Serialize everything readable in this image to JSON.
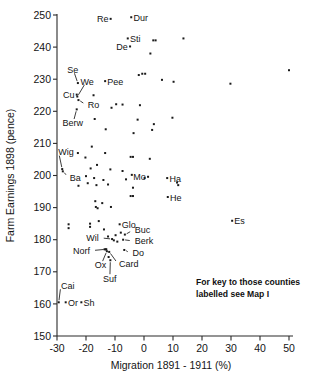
{
  "chart_data": {
    "type": "scatter",
    "title": "",
    "xlabel": "Migration  1891 - 1911 (%)",
    "ylabel": "Farm Earnings 1898 (pence)",
    "xlim": [
      -30,
      50
    ],
    "ylim": [
      150,
      250
    ],
    "xticks": [
      -30,
      -20,
      -10,
      0,
      10,
      20,
      30,
      40,
      50
    ],
    "yticks": [
      150,
      160,
      170,
      180,
      190,
      200,
      210,
      220,
      230,
      240,
      250
    ],
    "grid": false,
    "legend": null,
    "annotation": "For key to those counties labelled see Map I",
    "annotation_lines": [
      "For key to those counties",
      "labelled see Map I"
    ],
    "labelled_points": [
      {
        "label": "Re",
        "x": -11.5,
        "y": 248.8,
        "lx": -14.8,
        "ly": 248.8,
        "anchor": "end",
        "leader": false
      },
      {
        "label": "Dur",
        "x": -4.4,
        "y": 249.3,
        "lx": -3.5,
        "ly": 249.3,
        "anchor": "start",
        "leader": false
      },
      {
        "label": "Sti",
        "x": -5.6,
        "y": 242.7,
        "lx": -4.8,
        "ly": 242.5,
        "anchor": "start",
        "leader": false
      },
      {
        "label": "De",
        "x": -4.8,
        "y": 240.2,
        "lx": -6.0,
        "ly": 240.0,
        "anchor": "end",
        "leader": false
      },
      {
        "label": "Se",
        "x": -22.8,
        "y": 228.8,
        "lx": -24.6,
        "ly": 233.0,
        "anchor": "middle",
        "leader": true
      },
      {
        "label": "We",
        "x": -23.0,
        "y": 224.6,
        "lx": -19.6,
        "ly": 229.3,
        "anchor": "middle",
        "leader": true
      },
      {
        "label": "Pee",
        "x": -13.4,
        "y": 229.4,
        "lx": -12.6,
        "ly": 229.3,
        "anchor": "start",
        "leader": false
      },
      {
        "label": "Cu",
        "x": -23.2,
        "y": 225.2,
        "lx": -25.0,
        "ly": 225.2,
        "anchor": "end",
        "leader": false
      },
      {
        "label": "Ro",
        "x": -22.6,
        "y": 223.5,
        "lx": -19.4,
        "ly": 222.0,
        "anchor": "start",
        "leader": true
      },
      {
        "label": "Berw",
        "x": -23.2,
        "y": 220.6,
        "lx": -24.6,
        "ly": 216.4,
        "anchor": "middle",
        "leader": true
      },
      {
        "label": "Wig",
        "x": -28.2,
        "y": 202.0,
        "lx": -29.6,
        "ly": 207.4,
        "anchor": "start",
        "leader": true
      },
      {
        "label": "Ba",
        "x": -28.0,
        "y": 201.3,
        "lx": -25.6,
        "ly": 199.4,
        "anchor": "start",
        "leader": true
      },
      {
        "label": "Mo",
        "x": 1.4,
        "y": 199.6,
        "lx": 0.4,
        "ly": 199.6,
        "anchor": "end",
        "leader": false
      },
      {
        "label": "Ha",
        "x": 8.0,
        "y": 199.2,
        "lx": 8.8,
        "ly": 199.1,
        "anchor": "start",
        "leader": false
      },
      {
        "label": "He",
        "x": 8.2,
        "y": 193.3,
        "lx": 9.0,
        "ly": 193.2,
        "anchor": "start",
        "leader": false
      },
      {
        "label": "Es",
        "x": 30.4,
        "y": 185.9,
        "lx": 31.2,
        "ly": 185.8,
        "anchor": "start",
        "leader": false
      },
      {
        "label": "Glo",
        "x": -8.4,
        "y": 184.8,
        "lx": -7.6,
        "ly": 184.7,
        "anchor": "start",
        "leader": false
      },
      {
        "label": "Buc",
        "x": -6.6,
        "y": 181.6,
        "lx": -3.2,
        "ly": 183.0,
        "anchor": "start",
        "leader": true
      },
      {
        "label": "Wil",
        "x": -11.0,
        "y": 180.2,
        "lx": -15.6,
        "ly": 180.6,
        "anchor": "end",
        "leader": true
      },
      {
        "label": "Berk",
        "x": -7.2,
        "y": 180.0,
        "lx": -3.2,
        "ly": 179.6,
        "anchor": "start",
        "leader": true
      },
      {
        "label": "Norf",
        "x": -13.2,
        "y": 177.0,
        "lx": -18.6,
        "ly": 176.6,
        "anchor": "end",
        "leader": true
      },
      {
        "label": "Do",
        "x": -6.8,
        "y": 176.8,
        "lx": -4.0,
        "ly": 175.8,
        "anchor": "start",
        "leader": true
      },
      {
        "label": "Ox",
        "x": -12.8,
        "y": 176.4,
        "lx": -15.0,
        "ly": 172.2,
        "anchor": "middle",
        "leader": true
      },
      {
        "label": "Card",
        "x": -12.0,
        "y": 176.2,
        "lx": -8.6,
        "ly": 172.4,
        "anchor": "start",
        "leader": true
      },
      {
        "label": "Suf",
        "x": -11.6,
        "y": 173.6,
        "lx": -11.8,
        "ly": 168.0,
        "anchor": "middle",
        "leader": true
      },
      {
        "label": "Cai",
        "x": -29.4,
        "y": 160.5,
        "lx": -28.6,
        "ly": 165.8,
        "anchor": "start",
        "leader": true
      },
      {
        "label": "Or",
        "x": -27.0,
        "y": 160.5,
        "lx": -26.2,
        "ly": 160.4,
        "anchor": "start",
        "leader": false
      },
      {
        "label": "Sh",
        "x": -21.6,
        "y": 160.5,
        "lx": -20.8,
        "ly": 160.4,
        "anchor": "start",
        "leader": false
      }
    ],
    "unlabelled_points": [
      {
        "x": 3.2,
        "y": 242.1
      },
      {
        "x": 4.0,
        "y": 242.1
      },
      {
        "x": 13.6,
        "y": 242.7
      },
      {
        "x": 2.2,
        "y": 238.0
      },
      {
        "x": 50.0,
        "y": 232.8
      },
      {
        "x": -1.8,
        "y": 231.3
      },
      {
        "x": -0.6,
        "y": 231.7
      },
      {
        "x": 0.4,
        "y": 231.7
      },
      {
        "x": 6.2,
        "y": 229.8
      },
      {
        "x": 10.2,
        "y": 229.2
      },
      {
        "x": 29.8,
        "y": 228.6
      },
      {
        "x": -17.4,
        "y": 225.0
      },
      {
        "x": -9.6,
        "y": 222.2
      },
      {
        "x": -7.4,
        "y": 222.1
      },
      {
        "x": -1.4,
        "y": 221.9
      },
      {
        "x": -11.2,
        "y": 221.1
      },
      {
        "x": -17.0,
        "y": 217.6
      },
      {
        "x": -2.2,
        "y": 217.4
      },
      {
        "x": 9.8,
        "y": 218.0
      },
      {
        "x": 3.4,
        "y": 216.0
      },
      {
        "x": -13.2,
        "y": 214.4
      },
      {
        "x": -3.6,
        "y": 213.2
      },
      {
        "x": 2.8,
        "y": 214.2
      },
      {
        "x": -18.0,
        "y": 209.0
      },
      {
        "x": -22.8,
        "y": 207.0
      },
      {
        "x": -13.4,
        "y": 207.0
      },
      {
        "x": -20.2,
        "y": 205.6
      },
      {
        "x": -4.6,
        "y": 205.8
      },
      {
        "x": -3.8,
        "y": 205.8
      },
      {
        "x": 2.0,
        "y": 205.2
      },
      {
        "x": -16.2,
        "y": 203.3
      },
      {
        "x": -18.4,
        "y": 202.2
      },
      {
        "x": -11.6,
        "y": 201.9
      },
      {
        "x": -7.4,
        "y": 201.4
      },
      {
        "x": -4.2,
        "y": 200.2
      },
      {
        "x": -20.0,
        "y": 199.8
      },
      {
        "x": -17.2,
        "y": 199.2
      },
      {
        "x": -14.0,
        "y": 198.6
      },
      {
        "x": -6.2,
        "y": 198.8
      },
      {
        "x": 0.2,
        "y": 199.2
      },
      {
        "x": -19.4,
        "y": 197.6
      },
      {
        "x": -22.6,
        "y": 196.8
      },
      {
        "x": -16.4,
        "y": 197.0
      },
      {
        "x": -12.4,
        "y": 197.2
      },
      {
        "x": -3.8,
        "y": 196.2
      },
      {
        "x": 11.4,
        "y": 197.8
      },
      {
        "x": 11.8,
        "y": 197.0
      },
      {
        "x": -4.6,
        "y": 193.6
      },
      {
        "x": -3.8,
        "y": 193.6
      },
      {
        "x": -16.8,
        "y": 192.0
      },
      {
        "x": -14.4,
        "y": 191.4
      },
      {
        "x": -16.6,
        "y": 190.2
      },
      {
        "x": -16.0,
        "y": 189.8
      },
      {
        "x": -11.4,
        "y": 190.2
      },
      {
        "x": -18.6,
        "y": 185.0
      },
      {
        "x": -18.6,
        "y": 184.0
      },
      {
        "x": -15.6,
        "y": 185.8
      },
      {
        "x": -13.8,
        "y": 183.2
      },
      {
        "x": -12.4,
        "y": 181.0
      },
      {
        "x": -9.8,
        "y": 181.4
      },
      {
        "x": -8.0,
        "y": 182.2
      },
      {
        "x": -10.4,
        "y": 179.8
      },
      {
        "x": -9.2,
        "y": 179.4
      },
      {
        "x": -13.6,
        "y": 177.0
      },
      {
        "x": -13.0,
        "y": 177.0
      },
      {
        "x": -12.2,
        "y": 174.6
      },
      {
        "x": -26.0,
        "y": 184.8
      },
      {
        "x": -26.0,
        "y": 183.6
      }
    ]
  }
}
